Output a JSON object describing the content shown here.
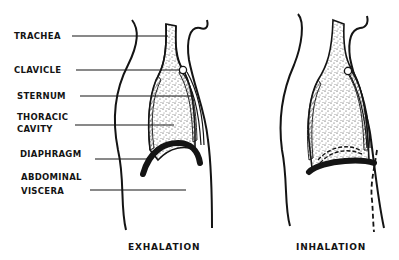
{
  "diagram": {
    "labels": {
      "trachea": "TRACHEA",
      "clavicle": "CLAVICLE",
      "sternum": "STERNUM",
      "thoracic_cavity_line1": "THORACIC",
      "thoracic_cavity_line2": "CAVITY",
      "diaphragm": "DIAPHRAGM",
      "abdominal_viscera_line1": "ABDOMINAL",
      "abdominal_viscera_line2": "VISCERA"
    },
    "captions": {
      "left": "EXHALATION",
      "right": "INHALATION"
    },
    "colors": {
      "ink": "#141414",
      "background": "#ffffff"
    }
  }
}
